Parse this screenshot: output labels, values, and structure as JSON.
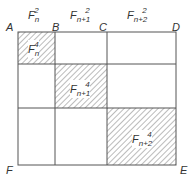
{
  "diagram": {
    "type": "square-decomposition",
    "vertices": {
      "A": "A",
      "B": "B",
      "C": "C",
      "D": "D",
      "E": "E",
      "F": "F"
    },
    "top_labels": [
      {
        "base": "F",
        "sub": "n",
        "sup": "2"
      },
      {
        "base": "F",
        "sub": "n+1",
        "sup": "2"
      },
      {
        "base": "F",
        "sub": "n+2",
        "sup": "2"
      }
    ],
    "hatched_squares": [
      {
        "base": "F",
        "sub": "n",
        "sup": "4"
      },
      {
        "base": "F",
        "sub": "n+1",
        "sup": "4"
      },
      {
        "base": "F",
        "sub": "n+2",
        "sup": "4"
      }
    ],
    "colors": {
      "line": "#555555",
      "hatch": "#777777",
      "background": "#ffffff"
    }
  }
}
